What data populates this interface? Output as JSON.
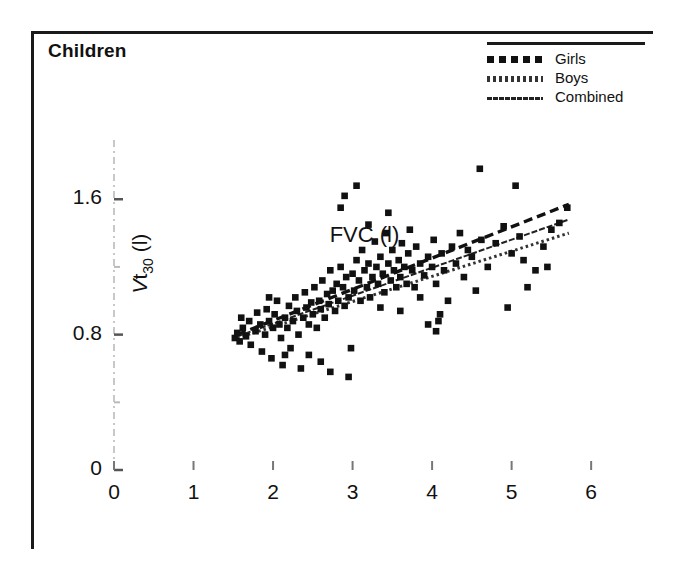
{
  "panel": {
    "title": "Children"
  },
  "legend": {
    "items": [
      {
        "label": "Girls",
        "style": "dashed-thick"
      },
      {
        "label": "Boys",
        "style": "dotted-fine"
      },
      {
        "label": "Combined",
        "style": "solid-thin"
      }
    ]
  },
  "chart_data": {
    "type": "scatter",
    "title": "Children",
    "xlabel": "FVC (l)",
    "ylabel": "Vt30 (l)",
    "xlim": [
      0,
      6.3
    ],
    "ylim": [
      0,
      1.95
    ],
    "grid": false,
    "legend_position": "top-right",
    "xticks": [
      0,
      1,
      2,
      3,
      4,
      5,
      6
    ],
    "xtick_labels": [
      "0",
      "1",
      "2",
      "3",
      "4",
      "5",
      "6"
    ],
    "yticks": [
      0,
      0.4,
      0.8,
      1.2,
      1.6
    ],
    "ytick_labels": [
      "0",
      "",
      "0.8",
      "",
      "1.6"
    ],
    "ytick_labels_shown": [
      "0",
      "0.8",
      "1.6"
    ],
    "marker": "square",
    "marker_color": "#111111",
    "points": [
      [
        1.52,
        0.78
      ],
      [
        1.55,
        0.81
      ],
      [
        1.58,
        0.76
      ],
      [
        1.62,
        0.84
      ],
      [
        1.66,
        0.79
      ],
      [
        1.7,
        0.88
      ],
      [
        1.72,
        0.74
      ],
      [
        1.78,
        0.82
      ],
      [
        1.8,
        0.93
      ],
      [
        1.84,
        0.86
      ],
      [
        1.86,
        0.7
      ],
      [
        1.9,
        0.8
      ],
      [
        1.92,
        0.95
      ],
      [
        1.95,
        0.88
      ],
      [
        1.98,
        0.66
      ],
      [
        2.0,
        0.84
      ],
      [
        2.02,
        0.92
      ],
      [
        2.05,
        1.0
      ],
      [
        2.08,
        0.86
      ],
      [
        2.1,
        0.78
      ],
      [
        2.12,
        0.62
      ],
      [
        2.15,
        0.9
      ],
      [
        2.18,
        0.84
      ],
      [
        2.2,
        0.97
      ],
      [
        2.22,
        0.72
      ],
      [
        2.25,
        0.88
      ],
      [
        2.28,
        1.02
      ],
      [
        2.3,
        0.94
      ],
      [
        2.32,
        0.8
      ],
      [
        2.35,
        0.6
      ],
      [
        2.38,
        0.9
      ],
      [
        2.4,
        1.05
      ],
      [
        2.42,
        0.96
      ],
      [
        2.45,
        0.86
      ],
      [
        2.48,
        0.99
      ],
      [
        2.5,
        0.92
      ],
      [
        2.52,
        1.08
      ],
      [
        2.55,
        0.84
      ],
      [
        2.58,
        1.0
      ],
      [
        2.6,
        0.95
      ],
      [
        2.62,
        1.12
      ],
      [
        2.65,
        0.9
      ],
      [
        2.68,
        1.04
      ],
      [
        2.7,
        0.98
      ],
      [
        2.72,
        1.18
      ],
      [
        2.75,
        1.06
      ],
      [
        2.78,
        0.94
      ],
      [
        2.8,
        1.1
      ],
      [
        2.82,
        1.0
      ],
      [
        2.85,
        1.2
      ],
      [
        2.88,
        1.08
      ],
      [
        2.9,
        0.97
      ],
      [
        2.92,
        1.14
      ],
      [
        2.95,
        1.02
      ],
      [
        2.98,
        0.72
      ],
      [
        3.0,
        1.16
      ],
      [
        3.02,
        1.06
      ],
      [
        3.05,
        1.24
      ],
      [
        3.08,
        1.12
      ],
      [
        3.1,
        1.0
      ],
      [
        3.12,
        1.3
      ],
      [
        3.15,
        1.18
      ],
      [
        3.18,
        1.08
      ],
      [
        3.2,
        1.22
      ],
      [
        3.22,
        1.02
      ],
      [
        3.25,
        1.14
      ],
      [
        3.28,
        1.35
      ],
      [
        3.3,
        1.2
      ],
      [
        3.32,
        1.1
      ],
      [
        3.35,
        1.26
      ],
      [
        3.38,
        1.16
      ],
      [
        3.4,
        1.05
      ],
      [
        3.42,
        1.4
      ],
      [
        3.45,
        1.22
      ],
      [
        3.48,
        1.12
      ],
      [
        3.5,
        1.3
      ],
      [
        3.52,
        1.18
      ],
      [
        3.55,
        1.08
      ],
      [
        3.58,
        1.24
      ],
      [
        3.6,
        1.14
      ],
      [
        3.62,
        1.34
      ],
      [
        3.65,
        1.2
      ],
      [
        3.68,
        1.1
      ],
      [
        3.7,
        1.28
      ],
      [
        3.72,
        1.42
      ],
      [
        3.75,
        1.18
      ],
      [
        3.78,
        1.08
      ],
      [
        3.8,
        1.32
      ],
      [
        3.85,
        1.22
      ],
      [
        3.9,
        1.15
      ],
      [
        3.95,
        1.26
      ],
      [
        4.0,
        1.2
      ],
      [
        4.02,
        1.36
      ],
      [
        4.05,
        1.1
      ],
      [
        4.08,
        0.88
      ],
      [
        4.1,
        0.92
      ],
      [
        4.12,
        1.28
      ],
      [
        4.15,
        1.18
      ],
      [
        4.2,
        1.0
      ],
      [
        4.25,
        1.32
      ],
      [
        4.3,
        1.22
      ],
      [
        4.35,
        1.4
      ],
      [
        4.4,
        1.14
      ],
      [
        4.45,
        1.3
      ],
      [
        4.5,
        1.26
      ],
      [
        4.6,
        1.78
      ],
      [
        4.62,
        1.36
      ],
      [
        4.7,
        1.2
      ],
      [
        4.8,
        1.34
      ],
      [
        4.9,
        1.44
      ],
      [
        4.95,
        0.96
      ],
      [
        5.0,
        1.28
      ],
      [
        5.05,
        1.68
      ],
      [
        5.1,
        1.38
      ],
      [
        5.2,
        1.08
      ],
      [
        5.3,
        1.18
      ],
      [
        5.4,
        1.32
      ],
      [
        5.5,
        1.42
      ],
      [
        5.6,
        1.46
      ],
      [
        5.7,
        1.55
      ],
      [
        2.9,
        1.62
      ],
      [
        3.05,
        1.68
      ],
      [
        3.45,
        1.52
      ],
      [
        3.2,
        1.45
      ],
      [
        2.85,
        1.55
      ],
      [
        2.72,
        0.58
      ],
      [
        2.95,
        0.55
      ],
      [
        2.6,
        0.64
      ],
      [
        3.95,
        0.86
      ],
      [
        4.05,
        0.82
      ],
      [
        1.6,
        0.9
      ],
      [
        1.95,
        1.02
      ],
      [
        2.45,
        0.68
      ],
      [
        2.15,
        0.68
      ],
      [
        3.35,
        0.96
      ],
      [
        3.6,
        0.94
      ],
      [
        3.85,
        1.02
      ],
      [
        4.55,
        1.06
      ],
      [
        5.15,
        1.24
      ],
      [
        5.45,
        1.2
      ]
    ],
    "series": [
      {
        "name": "Girls",
        "type": "line",
        "style": "dashed-thick",
        "x_start": 1.55,
        "y_start": 0.8,
        "x_end": 5.72,
        "y_end": 1.57
      },
      {
        "name": "Combined",
        "type": "line",
        "style": "solid-thin",
        "x_start": 1.55,
        "y_start": 0.79,
        "x_end": 5.72,
        "y_end": 1.48
      },
      {
        "name": "Boys",
        "type": "line",
        "style": "dotted-fine",
        "x_start": 1.55,
        "y_start": 0.78,
        "x_end": 5.72,
        "y_end": 1.4
      }
    ]
  }
}
